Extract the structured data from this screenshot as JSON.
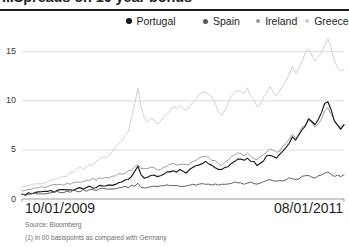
{
  "header": {
    "title": "...Spreads on 10 year bonds",
    "footnote_marker": "(1)"
  },
  "legend": {
    "position": "top-right",
    "items": [
      {
        "label": "Portugal",
        "color": "#1a1a1a",
        "marker": "legend-dot-portugal"
      },
      {
        "label": "Spain",
        "color": "#575757",
        "marker": "legend-dot-spain"
      },
      {
        "label": "Ireland",
        "color": "#9a9a9a",
        "marker": "legend-dot-ireland"
      },
      {
        "label": "Greece",
        "color": "#cfcfcf",
        "marker": "legend-dot-greece"
      }
    ]
  },
  "axis": {
    "x_start_label": "10/01/2009",
    "x_end_label": "08/01/2011",
    "y_ticks": [
      "0",
      "5",
      "10",
      "15"
    ]
  },
  "notes": {
    "source": "Source: Bloomberg",
    "footnote": "(1) in 00 basispoints as compared with Germany"
  },
  "chart_data": {
    "type": "line",
    "title": "...Spreads on 10 year bonds",
    "subtitle": "",
    "xlabel": "",
    "ylabel": "",
    "ylim": [
      0,
      16.5
    ],
    "ytick_values": [
      0,
      5,
      10,
      15
    ],
    "grid": true,
    "x_range": [
      "10/01/2009",
      "08/01/2011"
    ],
    "x_tick_labels": [
      "10/01/2009",
      "08/01/2011"
    ],
    "units": "00 basis points spread vs. Germany",
    "source": "Bloomberg",
    "legend_position": "top-right",
    "x": [
      0,
      1,
      2,
      3,
      4,
      5,
      6,
      7,
      8,
      9,
      10,
      11,
      12,
      13,
      14,
      15,
      16,
      17,
      18,
      19,
      20,
      21,
      22,
      23,
      24,
      25,
      26,
      27,
      28,
      29,
      30,
      31,
      32,
      33,
      34,
      35,
      36,
      37,
      38,
      39,
      40,
      41,
      42,
      43,
      44,
      45,
      46,
      47,
      48,
      49,
      50,
      51,
      52,
      53,
      54,
      55,
      56,
      57,
      58,
      59,
      60,
      61,
      62,
      63,
      64,
      65,
      66,
      67,
      68,
      69,
      70,
      71,
      72,
      73,
      74,
      75,
      76,
      77,
      78,
      79,
      80,
      81,
      82,
      83,
      84,
      85,
      86,
      87,
      88,
      89,
      90,
      91,
      92,
      93,
      94,
      95,
      96,
      97,
      98,
      99,
      100
    ],
    "series": [
      {
        "name": "Greece",
        "color": "#cfcfcf",
        "values": [
          1.2,
          1.3,
          1.3,
          1.4,
          1.5,
          1.5,
          1.6,
          1.7,
          1.8,
          1.9,
          2.0,
          2.1,
          2.2,
          2.3,
          2.4,
          2.6,
          2.8,
          3.0,
          3.2,
          3.1,
          3.3,
          3.6,
          3.4,
          3.7,
          4.0,
          4.3,
          4.1,
          4.4,
          4.8,
          5.2,
          5.6,
          6.0,
          6.4,
          7.0,
          8.2,
          9.6,
          11.2,
          9.4,
          8.3,
          7.9,
          8.3,
          8.0,
          7.7,
          8.0,
          8.4,
          8.8,
          9.1,
          9.4,
          9.2,
          9.5,
          9.3,
          9.1,
          9.4,
          9.8,
          10.2,
          10.6,
          10.9,
          11.0,
          10.8,
          10.4,
          9.8,
          9.0,
          8.4,
          8.9,
          9.6,
          10.4,
          10.8,
          11.1,
          11.0,
          10.9,
          11.2,
          10.6,
          10.0,
          9.4,
          9.8,
          10.3,
          10.9,
          11.4,
          11.0,
          10.6,
          11.0,
          11.6,
          12.2,
          12.8,
          13.4,
          12.9,
          13.5,
          14.1,
          14.7,
          15.4,
          14.6,
          13.9,
          14.4,
          15.1,
          15.8,
          16.2,
          15.4,
          14.2,
          13.4,
          12.9,
          13.1
        ]
      },
      {
        "name": "Ireland",
        "color": "#9a9a9a",
        "values": [
          0.9,
          0.9,
          1.0,
          1.0,
          1.1,
          1.1,
          1.2,
          1.2,
          1.3,
          1.3,
          1.4,
          1.4,
          1.5,
          1.5,
          1.6,
          1.6,
          1.7,
          1.7,
          1.8,
          1.8,
          1.9,
          1.9,
          2.0,
          2.0,
          2.1,
          2.1,
          2.2,
          2.2,
          2.3,
          2.4,
          2.5,
          2.6,
          2.7,
          2.8,
          3.0,
          3.2,
          3.5,
          3.2,
          3.0,
          3.1,
          3.2,
          3.1,
          3.0,
          3.1,
          3.3,
          3.4,
          3.5,
          3.6,
          3.5,
          3.6,
          3.5,
          3.4,
          3.5,
          3.7,
          3.9,
          4.1,
          4.2,
          4.3,
          4.2,
          4.0,
          3.8,
          3.6,
          3.5,
          3.7,
          3.9,
          4.2,
          4.4,
          4.6,
          4.5,
          4.4,
          4.6,
          4.4,
          4.2,
          4.0,
          4.2,
          4.5,
          4.8,
          5.1,
          4.9,
          4.7,
          5.0,
          5.4,
          5.8,
          6.2,
          6.6,
          6.3,
          6.7,
          7.2,
          7.6,
          8.1,
          7.7,
          7.4,
          7.8,
          8.3,
          8.8,
          9.2,
          8.6,
          8.0,
          7.6,
          7.3,
          7.5
        ]
      },
      {
        "name": "Portugal",
        "color": "#1a1a1a",
        "values": [
          0.5,
          0.5,
          0.55,
          0.6,
          0.6,
          0.65,
          0.7,
          0.7,
          0.75,
          0.8,
          0.8,
          0.85,
          0.9,
          0.9,
          0.95,
          1.0,
          1.0,
          1.05,
          1.1,
          1.1,
          1.15,
          1.2,
          1.2,
          1.25,
          1.3,
          1.35,
          1.3,
          1.4,
          1.5,
          1.6,
          1.7,
          1.8,
          1.9,
          2.0,
          2.3,
          2.7,
          3.3,
          2.5,
          2.2,
          2.3,
          2.5,
          2.4,
          2.3,
          2.4,
          2.6,
          2.7,
          2.8,
          2.9,
          2.8,
          2.9,
          2.8,
          2.7,
          2.9,
          3.1,
          3.3,
          3.5,
          3.6,
          3.7,
          3.6,
          3.4,
          3.2,
          3.0,
          2.9,
          3.1,
          3.4,
          3.7,
          3.9,
          4.1,
          4.0,
          3.9,
          4.1,
          3.9,
          3.7,
          3.5,
          3.7,
          4.0,
          4.3,
          4.6,
          4.4,
          4.2,
          4.5,
          4.9,
          5.3,
          5.8,
          6.3,
          6.0,
          6.5,
          7.1,
          7.6,
          8.2,
          7.8,
          7.5,
          8.1,
          8.8,
          9.6,
          10.1,
          9.0,
          8.0,
          7.4,
          7.0,
          7.6
        ]
      },
      {
        "name": "Spain",
        "color": "#575757",
        "values": [
          0.45,
          0.45,
          0.5,
          0.5,
          0.55,
          0.55,
          0.6,
          0.6,
          0.6,
          0.65,
          0.65,
          0.7,
          0.7,
          0.7,
          0.75,
          0.75,
          0.8,
          0.8,
          0.85,
          0.85,
          0.9,
          0.9,
          0.9,
          0.95,
          1.0,
          1.0,
          1.0,
          1.05,
          1.1,
          1.1,
          1.15,
          1.2,
          1.2,
          1.25,
          1.3,
          1.4,
          1.5,
          1.3,
          1.2,
          1.25,
          1.3,
          1.25,
          1.2,
          1.25,
          1.3,
          1.35,
          1.4,
          1.4,
          1.35,
          1.4,
          1.35,
          1.3,
          1.4,
          1.45,
          1.5,
          1.55,
          1.6,
          1.6,
          1.55,
          1.5,
          1.45,
          1.4,
          1.4,
          1.45,
          1.5,
          1.6,
          1.65,
          1.7,
          1.65,
          1.6,
          1.7,
          1.65,
          1.6,
          1.55,
          1.6,
          1.7,
          1.8,
          1.85,
          1.8,
          1.75,
          1.8,
          1.9,
          2.0,
          2.05,
          2.1,
          2.05,
          2.1,
          2.2,
          2.25,
          2.3,
          2.25,
          2.2,
          2.3,
          2.45,
          2.6,
          2.8,
          2.55,
          2.4,
          2.3,
          2.2,
          2.6
        ]
      }
    ]
  }
}
